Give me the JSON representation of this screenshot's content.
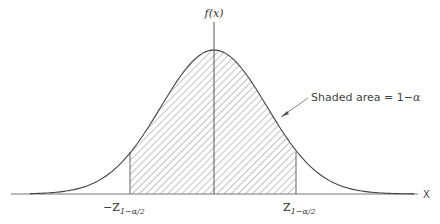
{
  "figure": {
    "type": "normal-distribution-diagram",
    "y_axis_label": "f(x)",
    "x_axis_label": "X",
    "annotation": {
      "text_prefix": "Shaded area = 1−",
      "text_alpha": "α"
    },
    "left_bound": {
      "sign": "−",
      "symbol": "Z",
      "subscript": "1−α/2"
    },
    "right_bound": {
      "symbol": "Z",
      "subscript": "1−α/2"
    },
    "colors": {
      "curve": "#444444",
      "axis": "#777777",
      "hatch": "#555555",
      "text": "#333333"
    }
  }
}
